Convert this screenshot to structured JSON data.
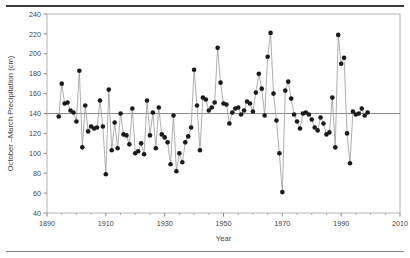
{
  "chart_data": {
    "type": "scatter",
    "title": "",
    "subtitle": "",
    "xlabel": "Year",
    "ylabel": "October –March Precipitation (cm)",
    "xlim": [
      1890,
      2010
    ],
    "ylim": [
      40,
      240
    ],
    "xticks": [
      1890,
      1910,
      1930,
      1950,
      1970,
      1990,
      2010
    ],
    "yticks": [
      40,
      60,
      80,
      100,
      120,
      140,
      160,
      180,
      200,
      220,
      240
    ],
    "xtick_labels": [
      "1890",
      "1910",
      "1930",
      "1950",
      "1970",
      "1990",
      "2010"
    ],
    "ytick_labels": [
      "40",
      "60",
      "80",
      "100",
      "120",
      "140",
      "160",
      "180",
      "200",
      "220",
      "240"
    ],
    "xminor_interval": 5,
    "grid": false,
    "legend": null,
    "legend_position": "none",
    "marker": "filled-circle",
    "marker_color": "#1a1a1a",
    "line_color": "#9a9a9a",
    "frame_color": "#b4b4b4",
    "reference_line": {
      "label": "mean",
      "value": 140,
      "orientation": "horizontal",
      "color": "#8c8c8c"
    },
    "x": [
      1894,
      1895,
      1896,
      1897,
      1898,
      1899,
      1900,
      1901,
      1902,
      1903,
      1904,
      1905,
      1906,
      1907,
      1908,
      1909,
      1910,
      1911,
      1912,
      1913,
      1914,
      1915,
      1916,
      1917,
      1918,
      1919,
      1920,
      1921,
      1922,
      1923,
      1924,
      1925,
      1926,
      1927,
      1928,
      1929,
      1930,
      1931,
      1932,
      1933,
      1934,
      1935,
      1936,
      1937,
      1938,
      1939,
      1940,
      1941,
      1942,
      1943,
      1944,
      1945,
      1946,
      1947,
      1948,
      1949,
      1950,
      1951,
      1952,
      1953,
      1954,
      1955,
      1956,
      1957,
      1958,
      1959,
      1960,
      1961,
      1962,
      1963,
      1964,
      1965,
      1966,
      1967,
      1968,
      1969,
      1970,
      1971,
      1972,
      1973,
      1974,
      1975,
      1976,
      1977,
      1978,
      1979,
      1980,
      1981,
      1982,
      1983,
      1984,
      1985,
      1986,
      1987,
      1988,
      1989,
      1990,
      1991,
      1992,
      1993,
      1994,
      1995,
      1996,
      1997,
      1998,
      1999
    ],
    "values": [
      137,
      170,
      150,
      151,
      143,
      141,
      132,
      183,
      106,
      148,
      122,
      127,
      125,
      126,
      153,
      127,
      79,
      164,
      103,
      131,
      105,
      140,
      119,
      118,
      109,
      145,
      100,
      102,
      110,
      99,
      153,
      118,
      141,
      105,
      146,
      119,
      116,
      111,
      89,
      138,
      82,
      100,
      91,
      111,
      117,
      126,
      184,
      148,
      103,
      156,
      154,
      143,
      146,
      151,
      206,
      171,
      150,
      149,
      130,
      141,
      145,
      146,
      139,
      143,
      152,
      150,
      142,
      161,
      180,
      165,
      138,
      197,
      221,
      160,
      133,
      100,
      61,
      163,
      172,
      155,
      139,
      132,
      125,
      140,
      141,
      139,
      134,
      126,
      123,
      136,
      130,
      119,
      121,
      156,
      106,
      219,
      190,
      196,
      120,
      90,
      142,
      139,
      140,
      145,
      138,
      141
    ]
  },
  "axis": {
    "ylabel": "October –March Precipitation (cm)",
    "xlabel": "Year"
  }
}
